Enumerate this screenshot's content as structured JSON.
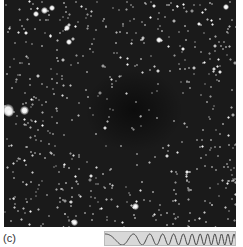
{
  "figure": {
    "panel_label": "(c)",
    "image_description": "Star field with dark nebula region",
    "background_color": "#1a1a1a",
    "star_color": "#ffffff"
  },
  "waveform": {
    "description": "chirp sinusoid, increasing frequency left to right",
    "background_color": "#d8d8d8",
    "line_color": "#444444"
  }
}
